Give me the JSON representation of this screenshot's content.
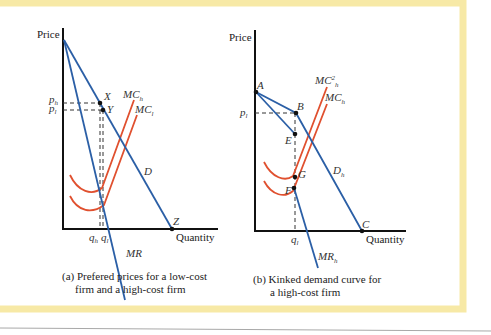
{
  "colors": {
    "frame_border": "#f7e9a6",
    "axis": "#111111",
    "demand": "#2b5fa6",
    "marginal_cost": "#e0502f",
    "dashed": "#333333",
    "bottom_rule": "#999999"
  },
  "panel_a": {
    "y_axis_label": "Price",
    "x_axis_label": "Quantity",
    "price_labels": {
      "high": "p",
      "high_sub": "h",
      "low": "p",
      "low_sub": "l"
    },
    "quantity_labels": {
      "high": "q",
      "high_sub": "h",
      "low": "q",
      "low_sub": "l"
    },
    "points": {
      "x": "X",
      "y": "Y",
      "z": "Z"
    },
    "curves": {
      "mc_high": "MC",
      "mc_high_sub": "h",
      "mc_low": "MC",
      "mc_low_sub": "l",
      "demand": "D",
      "marginal_revenue": "MR"
    },
    "caption_line1": "(a) Prefered prices for a low-cost",
    "caption_line2": "firm and a high-cost firm"
  },
  "panel_b": {
    "y_axis_label": "Price",
    "x_axis_label": "Quantity",
    "price_labels": {
      "low": "p",
      "low_sub": "l"
    },
    "quantity_labels": {
      "low": "q",
      "low_sub": "l"
    },
    "points": {
      "a": "A",
      "b": "B",
      "c": "C",
      "e": "E",
      "f": "F",
      "g": "G"
    },
    "curves": {
      "mc2_high": "MC",
      "mc2_high_sup": "2",
      "mc2_high_sub": "h",
      "mc_high": "MC",
      "mc_high_sub": "h",
      "demand": "D",
      "demand_sub": "h",
      "marginal_revenue": "MR",
      "marginal_revenue_sub": "h"
    },
    "caption_line1": "(b) Kinked demand curve for",
    "caption_line2": "a high-cost firm"
  }
}
